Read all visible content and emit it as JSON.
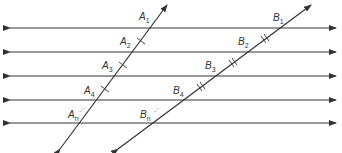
{
  "diagram": {
    "title": "",
    "parallel_lines_y": [
      28,
      52,
      76,
      100,
      123
    ],
    "line_color": "#333333",
    "transversal_a": {
      "points": [
        {
          "label": "A",
          "sub": "1"
        },
        {
          "label": "A",
          "sub": "2"
        },
        {
          "label": "A",
          "sub": "3"
        },
        {
          "label": "A",
          "sub": "4"
        },
        {
          "label": "A",
          "sub": "n"
        }
      ],
      "tick_mark": "single"
    },
    "transversal_b": {
      "points": [
        {
          "label": "B",
          "sub": "1"
        },
        {
          "label": "B",
          "sub": "2"
        },
        {
          "label": "B",
          "sub": "3"
        },
        {
          "label": "B",
          "sub": "4"
        },
        {
          "label": "B",
          "sub": "n"
        }
      ],
      "tick_mark": "double"
    },
    "ellipsis": "..."
  }
}
